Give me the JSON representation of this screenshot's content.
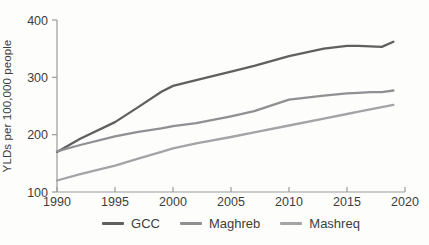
{
  "chart_data": {
    "type": "line",
    "ylabel": "YLDs per 100,000 people",
    "xlabel": "",
    "ylim": [
      100,
      400
    ],
    "xlim": [
      1990,
      2020
    ],
    "yticks": [
      100,
      200,
      300,
      400
    ],
    "xticks": [
      1990,
      1995,
      2000,
      2005,
      2010,
      2015,
      2020
    ],
    "grid": false,
    "legend_position": "bottom",
    "x": [
      1990,
      1992,
      1995,
      1997,
      1999,
      2000,
      2002,
      2005,
      2007,
      2010,
      2013,
      2015,
      2016,
      2017,
      2018,
      2019
    ],
    "series": [
      {
        "name": "GCC",
        "color": "#606060",
        "values": [
          170,
          193,
          222,
          248,
          275,
          285,
          295,
          310,
          320,
          337,
          350,
          355,
          355,
          354,
          353,
          362
        ]
      },
      {
        "name": "Maghreb",
        "color": "#8e9092",
        "values": [
          171,
          182,
          197,
          205,
          211,
          215,
          220,
          232,
          241,
          261,
          268,
          272,
          273,
          274,
          274,
          277
        ]
      },
      {
        "name": "Mashreq",
        "color": "#a2a4a6",
        "values": [
          120,
          131,
          146,
          158,
          170,
          176,
          185,
          196,
          204,
          216,
          228,
          236,
          240,
          244,
          248,
          252
        ]
      }
    ],
    "axis_color": "#9b9b9b",
    "text_color": "#3d3d3d"
  }
}
